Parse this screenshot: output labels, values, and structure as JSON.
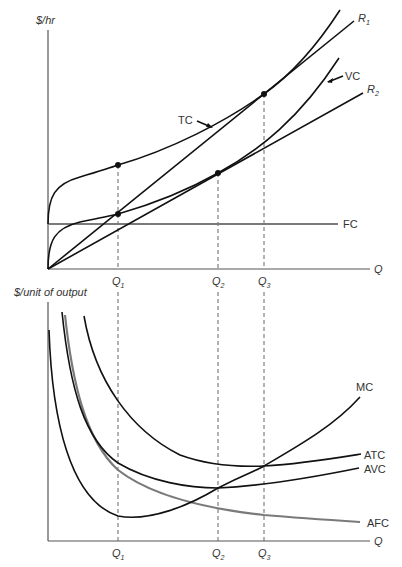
{
  "top_panel": {
    "y_label": "$/hr",
    "x_label": "Q",
    "curves": {
      "tc": "TC",
      "vc": "VC",
      "fc": "FC",
      "r1_base": "R",
      "r1_sub": "1",
      "r2_base": "R",
      "r2_sub": "2"
    },
    "ticks": [
      {
        "base": "Q",
        "sub": "1"
      },
      {
        "base": "Q",
        "sub": "2"
      },
      {
        "base": "Q",
        "sub": "3"
      }
    ]
  },
  "bottom_panel": {
    "y_label": "$/unit of output",
    "x_label": "Q",
    "curves": {
      "mc": "MC",
      "atc": "ATC",
      "avc": "AVC",
      "afc": "AFC"
    },
    "ticks": [
      {
        "base": "Q",
        "sub": "1"
      },
      {
        "base": "Q",
        "sub": "2"
      },
      {
        "base": "Q",
        "sub": "3"
      }
    ]
  },
  "colors": {
    "curve": "#111111",
    "fc_afc": "#7a7a7a",
    "axis": "#555555"
  }
}
